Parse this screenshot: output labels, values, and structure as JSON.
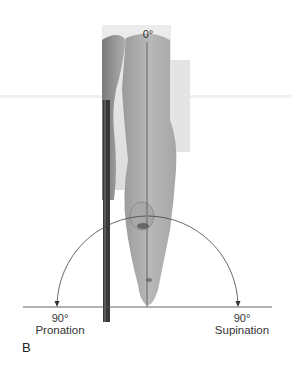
{
  "figure": {
    "panel_letter": "B",
    "reference_label": "0°",
    "left_end": {
      "degrees": "90°",
      "name": "Pronation"
    },
    "right_end": {
      "degrees": "90°",
      "name": "Supination"
    }
  },
  "colors": {
    "line": "#555555",
    "ruler": "#3a3a3a",
    "skin_dark": "#8a8a8a",
    "skin_light": "#c8c8c8",
    "background_panel": "#e2e2e2"
  }
}
